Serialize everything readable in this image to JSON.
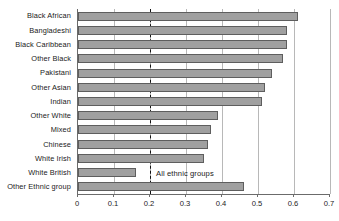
{
  "chart_data": {
    "type": "bar",
    "orientation": "horizontal",
    "title": "",
    "xlabel": "",
    "ylabel": "",
    "xlim": [
      0,
      0.7
    ],
    "xticks": [
      0,
      0.1,
      0.2,
      0.3,
      0.4,
      0.5,
      0.6,
      0.7
    ],
    "xtick_labels": [
      "0",
      "0.1",
      "0.2",
      "0.3",
      "0.4",
      "0.5",
      "0.6",
      "0.7"
    ],
    "grid": "vertical",
    "legend": "none",
    "bar_color": "#a0a0a0",
    "bar_edge_color": "#5e5e5e",
    "reference_line": {
      "value": 0.2,
      "style": "dashed",
      "color": "#111111",
      "label": "All ethnic groups"
    },
    "categories": [
      "Black African",
      "Bangladeshi",
      "Black Caribbean",
      "Other Black",
      "Pakistani",
      "Other Asian",
      "Indian",
      "Other White",
      "Mixed",
      "Chinese",
      "White Irish",
      "White British",
      "Other Ethnic group"
    ],
    "values": [
      0.61,
      0.58,
      0.58,
      0.57,
      0.54,
      0.52,
      0.51,
      0.39,
      0.37,
      0.36,
      0.35,
      0.16,
      0.46
    ]
  }
}
